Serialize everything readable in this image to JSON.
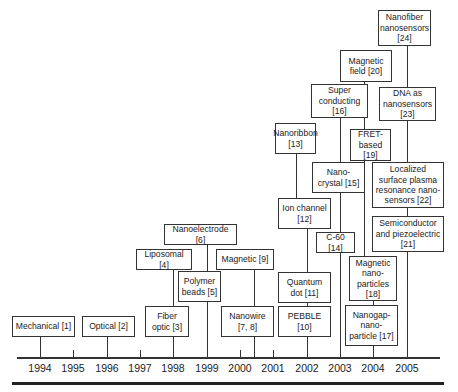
{
  "years": [
    "1994",
    "1995",
    "1996",
    "1997",
    "1998",
    "1999",
    "2000",
    "2001",
    "2002",
    "2003",
    "2004",
    "2005"
  ],
  "items": [
    {
      "id": 1,
      "label": "Mechanical [1]",
      "year": "1994"
    },
    {
      "id": 2,
      "label": "Optical [2]",
      "year": "1996"
    },
    {
      "id": 3,
      "label": "Fiber\noptic [3]",
      "year": "1998"
    },
    {
      "id": 4,
      "label": "Liposomal [4]",
      "year": "1998"
    },
    {
      "id": 5,
      "label": "Polymer\nbeads [5]",
      "year": "1999"
    },
    {
      "id": 6,
      "label": "Nanoelectrode [6]",
      "year": "1999"
    },
    {
      "id": 7,
      "label": "Nanowire\n[7, 8]",
      "year": "2000"
    },
    {
      "id": 8,
      "label": "Magnetic [9]",
      "year": "2000"
    },
    {
      "id": 9,
      "label": "PEBBLE\n[10]",
      "year": "2002"
    },
    {
      "id": 10,
      "label": "Quantum\ndot [11]",
      "year": "2002"
    },
    {
      "id": 11,
      "label": "Ion channel\n[12]",
      "year": "2002"
    },
    {
      "id": 12,
      "label": "Nanoribbon\n[13]",
      "year": "2002"
    },
    {
      "id": 13,
      "label": "C-60 [14]",
      "year": "2003"
    },
    {
      "id": 14,
      "label": "Nano-\ncrystal [15]",
      "year": "2003"
    },
    {
      "id": 15,
      "label": "Super\nconducting\n[16]",
      "year": "2003"
    },
    {
      "id": 16,
      "label": "Nanogap-\nnano-\nparticle [17]",
      "year": "2004"
    },
    {
      "id": 17,
      "label": "Magnetic\nnano-\nparticles\n[18]",
      "year": "2004"
    },
    {
      "id": 18,
      "label": "FRET-\nbased [19]",
      "year": "2004"
    },
    {
      "id": 19,
      "label": "Magnetic\nfield [20]",
      "year": "2004"
    },
    {
      "id": 20,
      "label": "Semiconductor\nand piezoelectric\n[21]",
      "year": "2005"
    },
    {
      "id": 21,
      "label": "Localized\nsurface plasma\nresonance nano-\nsensors [22]",
      "year": "2005"
    },
    {
      "id": 22,
      "label": "DNA as\nnanosensors\n[23]",
      "year": "2005"
    },
    {
      "id": 23,
      "label": "Nanofiber\nnanosensors\n[24]",
      "year": "2005"
    }
  ]
}
